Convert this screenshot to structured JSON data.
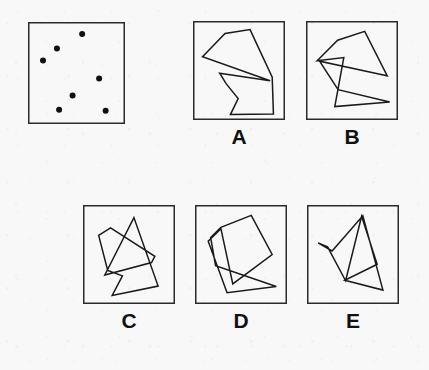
{
  "puzzle": {
    "title": "Dot-pattern figure matching item",
    "stroke_color": "#1a1a1a",
    "dot_color": "#101010",
    "background_color": "#fbfbfb",
    "box_border_color": "#2b2b2b",
    "label_color": "#111111"
  },
  "reference": {
    "name": "reference-dot-pattern",
    "box": {
      "x": 28,
      "y": 22,
      "w": 97,
      "h": 102
    },
    "dot_count": 7,
    "dot_radius": 3.0,
    "dots": [
      {
        "id": "dot-1",
        "x": 0.565,
        "y": 0.075
      },
      {
        "id": "dot-2",
        "x": 0.275,
        "y": 0.235
      },
      {
        "id": "dot-3",
        "x": 0.115,
        "y": 0.365
      },
      {
        "id": "dot-4",
        "x": 0.76,
        "y": 0.56
      },
      {
        "id": "dot-5",
        "x": 0.455,
        "y": 0.745
      },
      {
        "id": "dot-6",
        "x": 0.3,
        "y": 0.9
      },
      {
        "id": "dot-7",
        "x": 0.835,
        "y": 0.91
      }
    ]
  },
  "options": [
    {
      "id": "option-a",
      "label": "A",
      "box": {
        "x": 193,
        "y": 21,
        "w": 92,
        "h": 99
      },
      "label_pos": {
        "x": 193,
        "y": 126,
        "w": 92
      },
      "stroke_width": 1.5,
      "closed": true,
      "points": [
        [
          0.055,
          0.345
        ],
        [
          0.33,
          0.085
        ],
        [
          0.635,
          0.04
        ],
        [
          0.905,
          0.575
        ],
        [
          0.92,
          0.99
        ],
        [
          0.395,
          0.995
        ],
        [
          0.49,
          0.815
        ],
        [
          0.345,
          0.65
        ],
        [
          0.265,
          0.53
        ],
        [
          0.88,
          0.615
        ]
      ]
    },
    {
      "id": "option-b",
      "label": "B",
      "box": {
        "x": 306,
        "y": 21,
        "w": 92,
        "h": 99
      },
      "label_pos": {
        "x": 306,
        "y": 126,
        "w": 92
      },
      "stroke_width": 1.5,
      "closed": true,
      "points": [
        [
          0.075,
          0.39
        ],
        [
          0.325,
          0.16
        ],
        [
          0.655,
          0.06
        ],
        [
          0.93,
          0.56
        ],
        [
          0.855,
          0.545
        ],
        [
          0.105,
          0.395
        ],
        [
          0.33,
          0.715
        ],
        [
          0.96,
          0.855
        ],
        [
          0.29,
          0.905
        ],
        [
          0.4,
          0.355
        ]
      ]
    },
    {
      "id": "option-c",
      "label": "C",
      "box": {
        "x": 83,
        "y": 205,
        "w": 92,
        "h": 99
      },
      "label_pos": {
        "x": 83,
        "y": 310,
        "w": 92
      },
      "stroke_width": 1.5,
      "closed": true,
      "points": [
        [
          0.13,
          0.285
        ],
        [
          0.275,
          0.2
        ],
        [
          0.815,
          0.52
        ],
        [
          0.775,
          0.59
        ],
        [
          0.205,
          0.73
        ],
        [
          0.56,
          0.085
        ],
        [
          0.855,
          0.855
        ],
        [
          0.295,
          0.96
        ],
        [
          0.42,
          0.74
        ],
        [
          0.24,
          0.68
        ]
      ]
    },
    {
      "id": "option-d",
      "label": "D",
      "box": {
        "x": 195,
        "y": 205,
        "w": 92,
        "h": 99
      },
      "label_pos": {
        "x": 195,
        "y": 310,
        "w": 92
      },
      "stroke_width": 1.5,
      "closed": true,
      "points": [
        [
          0.13,
          0.31
        ],
        [
          0.255,
          0.195
        ],
        [
          0.625,
          0.06
        ],
        [
          0.88,
          0.5
        ],
        [
          0.4,
          0.83
        ],
        [
          0.255,
          0.21
        ],
        [
          0.1,
          0.35
        ],
        [
          0.33,
          0.93
        ],
        [
          0.93,
          0.86
        ],
        [
          0.19,
          0.625
        ]
      ]
    },
    {
      "id": "option-e",
      "label": "E",
      "box": {
        "x": 307,
        "y": 205,
        "w": 92,
        "h": 99
      },
      "label_pos": {
        "x": 307,
        "y": 310,
        "w": 92
      },
      "stroke_width": 1.5,
      "closed": true,
      "points": [
        [
          0.075,
          0.37
        ],
        [
          0.245,
          0.46
        ],
        [
          0.62,
          0.065
        ],
        [
          0.865,
          0.9
        ],
        [
          0.4,
          0.79
        ],
        [
          0.795,
          0.61
        ],
        [
          0.605,
          0.07
        ],
        [
          0.41,
          0.795
        ],
        [
          0.19,
          0.415
        ]
      ]
    }
  ]
}
